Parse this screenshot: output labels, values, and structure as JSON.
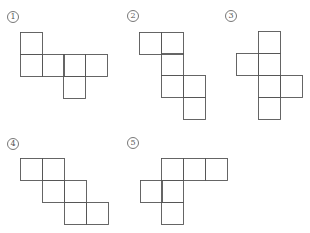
{
  "figures": [
    {
      "label": "1",
      "label_pos": [
        13,
        17
      ],
      "squares": [
        [
          20,
          32
        ],
        [
          20,
          54
        ],
        [
          42,
          54
        ],
        [
          63,
          54
        ],
        [
          85,
          54
        ],
        [
          63,
          76
        ]
      ]
    },
    {
      "label": "2",
      "label_pos": [
        133,
        16
      ],
      "squares": [
        [
          139,
          32
        ],
        [
          161,
          32
        ],
        [
          161,
          53
        ],
        [
          161,
          75
        ],
        [
          183,
          75
        ],
        [
          183,
          97
        ]
      ]
    },
    {
      "label": "3",
      "label_pos": [
        231,
        16
      ],
      "squares": [
        [
          258,
          31
        ],
        [
          236,
          53
        ],
        [
          258,
          53
        ],
        [
          258,
          75
        ],
        [
          280,
          75
        ],
        [
          258,
          97
        ]
      ]
    },
    {
      "label": "4",
      "label_pos": [
        13,
        144
      ],
      "squares": [
        [
          20,
          158
        ],
        [
          42,
          158
        ],
        [
          42,
          180
        ],
        [
          64,
          180
        ],
        [
          64,
          202
        ],
        [
          86,
          202
        ]
      ]
    },
    {
      "label": "5",
      "label_pos": [
        133,
        143
      ],
      "squares": [
        [
          161,
          158
        ],
        [
          183,
          158
        ],
        [
          205,
          158
        ],
        [
          140,
          180
        ],
        [
          161,
          180
        ],
        [
          161,
          202
        ]
      ]
    }
  ],
  "square_size": 22,
  "stroke_color": "#555555"
}
